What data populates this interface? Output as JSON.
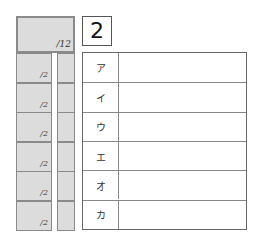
{
  "score_total": {
    "label": "/12"
  },
  "question": {
    "number": "2"
  },
  "rows": [
    {
      "key": "ア",
      "points": "/2"
    },
    {
      "key": "イ",
      "points": "/2"
    },
    {
      "key": "ウ",
      "points": "/2"
    },
    {
      "key": "エ",
      "points": "/2"
    },
    {
      "key": "オ",
      "points": "/2"
    },
    {
      "key": "カ",
      "points": "/2"
    }
  ],
  "colors": {
    "score_fill": "#dcdcdc",
    "border": "#8a8a8a"
  }
}
